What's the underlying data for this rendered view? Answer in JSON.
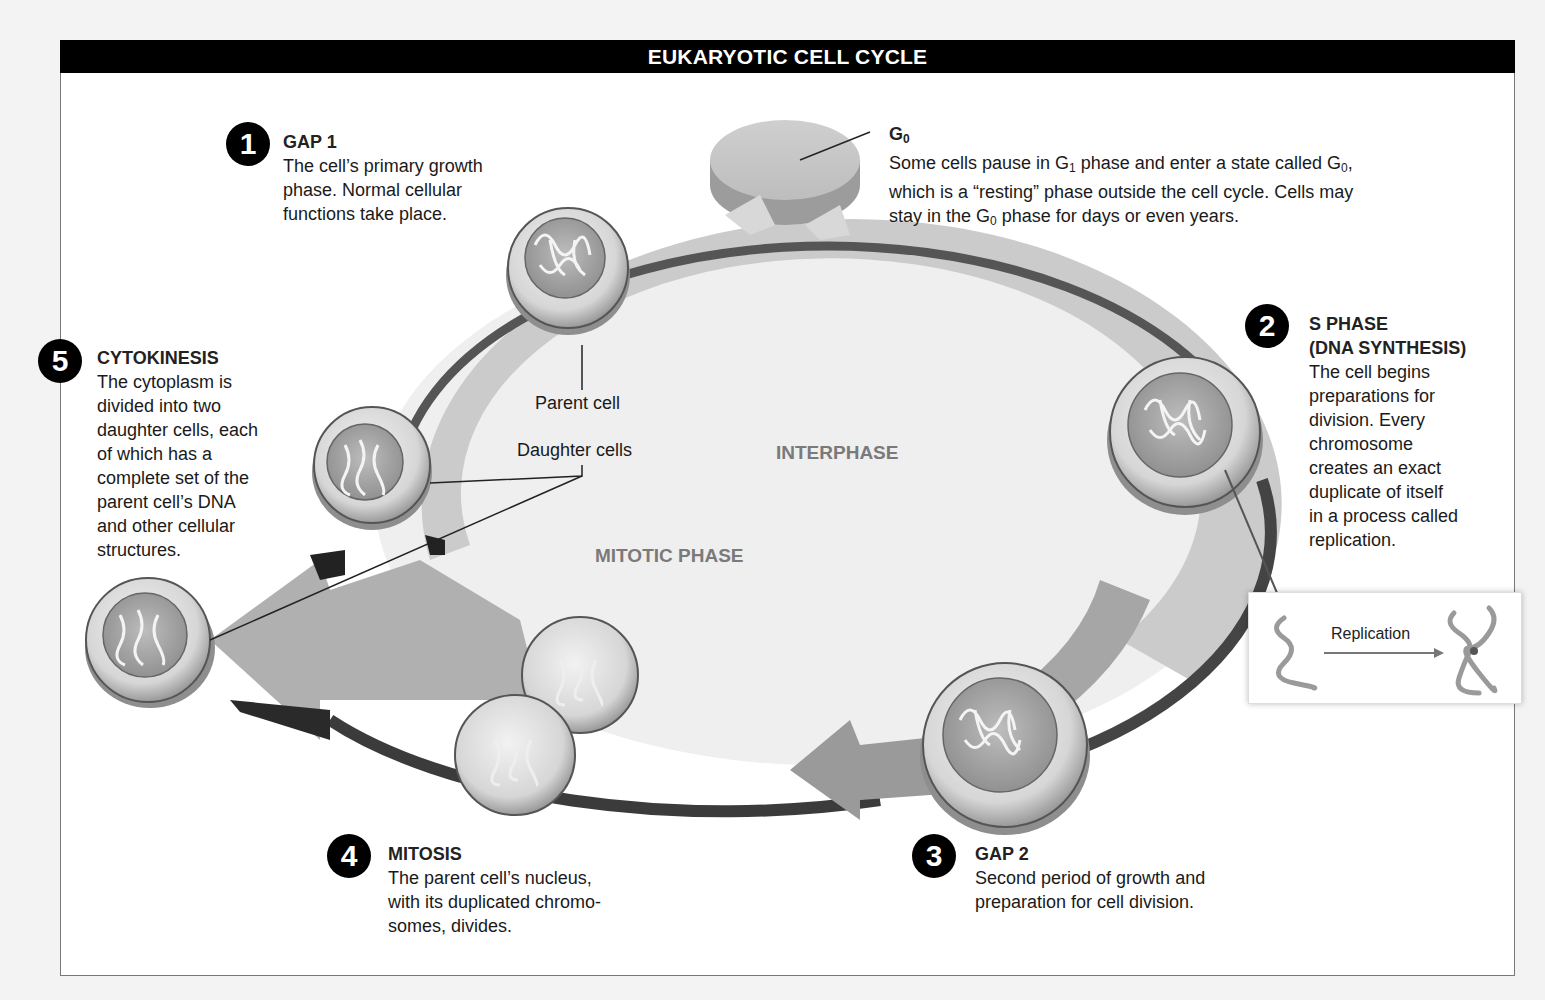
{
  "title": "EUKARYOTIC CELL CYCLE",
  "phases": {
    "interphase": "INTERPHASE",
    "mitotic": "MITOTIC PHASE"
  },
  "callouts": {
    "parent_cell": "Parent cell",
    "daughter_cells": "Daughter cells",
    "replication": "Replication"
  },
  "g0": {
    "heading_main": "G",
    "heading_sub": "0",
    "line1_a": "Some cells pause in G",
    "line1_sub1": "1",
    "line1_b": " phase and enter a state called G",
    "line1_sub2": "0",
    "line1_c": ",",
    "line2": "which is a “resting” phase outside the cell cycle. Cells may",
    "line3_a": "stay in the G",
    "line3_sub": "0",
    "line3_b": " phase for days or even years."
  },
  "steps": [
    {
      "number": "1",
      "heading": "GAP 1",
      "text": [
        "The cell’s primary growth",
        "phase. Normal cellular",
        "functions take place."
      ]
    },
    {
      "number": "2",
      "heading": [
        "S PHASE",
        "(DNA SYNTHESIS)"
      ],
      "text": [
        "The cell begins",
        "preparations for",
        "division. Every",
        "chromosome",
        "creates an exact",
        "duplicate of itself",
        "in a process called",
        "replication."
      ]
    },
    {
      "number": "3",
      "heading": "GAP 2",
      "text": [
        "Second period of growth and",
        "preparation for cell division."
      ]
    },
    {
      "number": "4",
      "heading": "MITOSIS",
      "text": [
        "The parent cell’s nucleus,",
        "with its duplicated chromo-",
        "somes, divides."
      ]
    },
    {
      "number": "5",
      "heading": "CYTOKINESIS",
      "text": [
        "The cytoplasm is",
        "divided into two",
        "daughter cells, each",
        "of which has a",
        "complete set of the",
        "parent cell’s DNA",
        "and other cellular",
        "structures."
      ]
    }
  ],
  "colors": {
    "title_bg": "#000000",
    "ring_light": "#c9c9c9",
    "ring_mid": "#a9a9a9",
    "ring_dark": "#4a4a4a",
    "phase_text": "#7a7a7a"
  }
}
